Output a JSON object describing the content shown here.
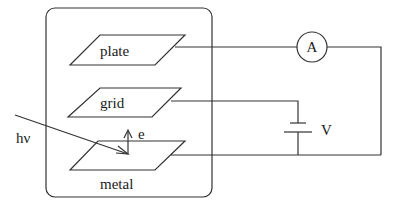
{
  "diagram": {
    "labels": {
      "plate": "plate",
      "grid": "grid",
      "metal": "metal",
      "photon": "hν",
      "electron": "e",
      "ammeter": "A",
      "voltage": "V"
    },
    "colors": {
      "line": "#333333",
      "text": "#1a1a1a",
      "background": "#ffffff"
    }
  }
}
